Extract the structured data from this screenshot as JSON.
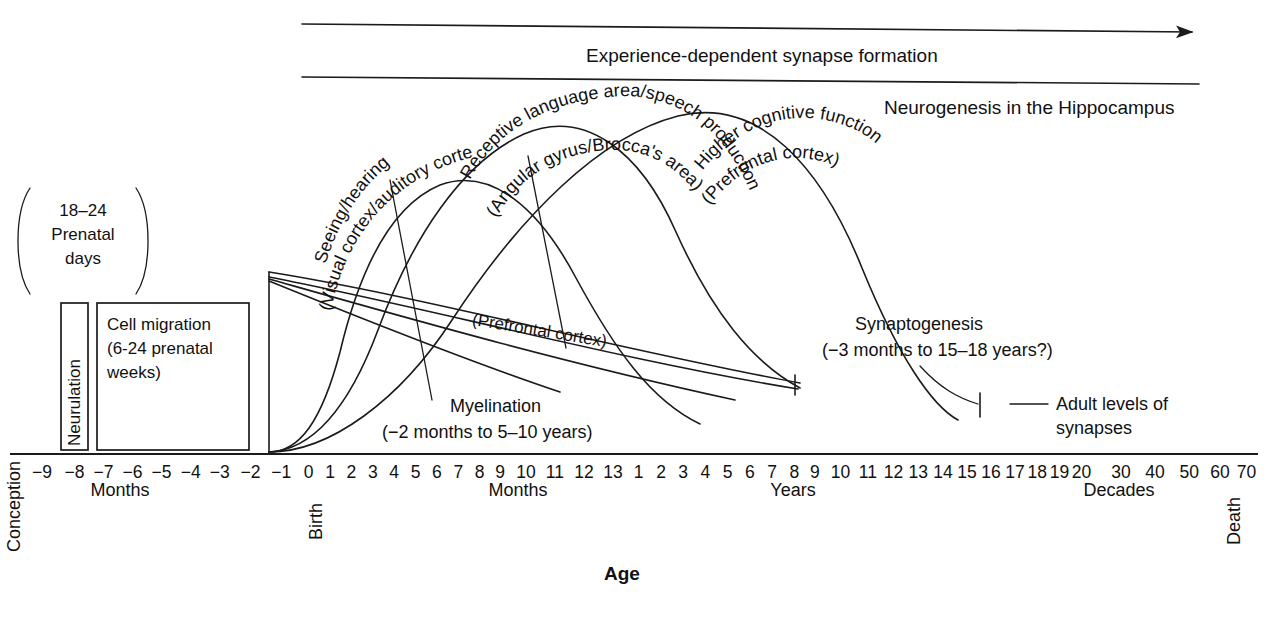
{
  "figure": {
    "axis_title": "Age",
    "ink_color": "#1b1b1b",
    "background": "#ffffff"
  },
  "top_bands": {
    "experience_dependent": "Experience-dependent synapse formation",
    "neurogenesis": "Neurogenesis in the Hippocampus"
  },
  "prenatal": {
    "bracket_line1": "18–24",
    "bracket_line2": "Prenatal",
    "bracket_line3": "days",
    "neurulation": "Neurulation",
    "cell_migration_line1": "Cell migration",
    "cell_migration_line2": "(6-24 prenatal",
    "cell_migration_line3": "weeks)"
  },
  "curves": {
    "sensory_line1": "Seeing/hearing",
    "sensory_line2": "(Visual cortex/auditory cortex)",
    "language_line1": "Receptive language area/speech production",
    "language_line2": "(Angular gyrus/Brocca's area)",
    "cognitive_line1": "Higher cognitive function",
    "cognitive_line2": "(Prefrontal cortex)"
  },
  "annotations": {
    "myelination_line1": "Myelination",
    "myelination_line2": "(−2 months to 5–10 years)",
    "myelination_region": "(Prefrontal cortex)",
    "synaptogenesis_line1": "Synaptogenesis",
    "synaptogenesis_line2": "(−3 months to 15–18 years?)",
    "adult_levels_line1": "Adult levels of",
    "adult_levels_line2": "synapses"
  },
  "axis": {
    "label_conception": "Conception",
    "label_birth": "Birth",
    "label_death": "Death",
    "unit_months_prenatal": "Months",
    "unit_months_postnatal": "Months",
    "unit_years": "Years",
    "unit_decades": "Decades",
    "ticks": [
      {
        "label": "−9",
        "x": 28
      },
      {
        "label": "−8",
        "x": 66
      },
      {
        "label": "−7",
        "x": 100
      },
      {
        "label": "−6",
        "x": 134
      },
      {
        "label": "−5",
        "x": 168
      },
      {
        "label": "−4",
        "x": 202
      },
      {
        "label": "−3",
        "x": 236
      },
      {
        "label": "−2",
        "x": 272
      },
      {
        "label": "−1",
        "x": 308
      },
      {
        "label": "0",
        "x": 340
      },
      {
        "label": "1",
        "x": 365
      },
      {
        "label": "2",
        "x": 390
      },
      {
        "label": "3",
        "x": 415
      },
      {
        "label": "4",
        "x": 440
      },
      {
        "label": "5",
        "x": 465
      },
      {
        "label": "6",
        "x": 490
      },
      {
        "label": "7",
        "x": 515
      },
      {
        "label": "8",
        "x": 540
      },
      {
        "label": "9",
        "x": 564
      },
      {
        "label": "10",
        "x": 594
      },
      {
        "label": "11",
        "x": 628
      },
      {
        "label": "12",
        "x": 662
      },
      {
        "label": "13",
        "x": 696
      },
      {
        "label": "1",
        "x": 726
      },
      {
        "label": "2",
        "x": 752
      },
      {
        "label": "3",
        "x": 778
      },
      {
        "label": "4",
        "x": 804
      },
      {
        "label": "5",
        "x": 830
      },
      {
        "label": "6",
        "x": 856
      },
      {
        "label": "7",
        "x": 882
      },
      {
        "label": "8",
        "x": 908
      },
      {
        "label": "9",
        "x": 932
      },
      {
        "label": "10",
        "x": 962
      },
      {
        "label": "11",
        "x": 994
      },
      {
        "label": "12",
        "x": 1024
      },
      {
        "label": "13",
        "x": 1053
      },
      {
        "label": "14",
        "x": 1082
      },
      {
        "label": "15",
        "x": 1110
      },
      {
        "label": "16",
        "x": 1138
      },
      {
        "label": "17",
        "x": 1166
      },
      {
        "label": "18",
        "x": 1192
      },
      {
        "label": "19",
        "x": 1218
      },
      {
        "label": "20",
        "x": 1244
      },
      {
        "label": "30",
        "x": 1290
      },
      {
        "label": "40",
        "x": 1330
      },
      {
        "label": "50",
        "x": 1370
      },
      {
        "label": "60",
        "x": 1406
      },
      {
        "label": "70",
        "x": 1437
      }
    ]
  },
  "chart_data": {
    "type": "line",
    "xlabel": "Age",
    "ylabel": "",
    "grid": false,
    "legend_position": "inline-curve-labels",
    "x_axis": {
      "segments": [
        {
          "unit": "Months",
          "phase": "prenatal",
          "ticks": [
            -9,
            -8,
            -7,
            -6,
            -5,
            -4,
            -3,
            -2,
            -1
          ]
        },
        {
          "unit": "Months",
          "phase": "postnatal",
          "ticks": [
            0,
            1,
            2,
            3,
            4,
            5,
            6,
            7,
            8,
            9,
            10,
            11,
            12,
            13
          ]
        },
        {
          "unit": "Years",
          "phase": "childhood-adolescence",
          "ticks": [
            1,
            2,
            3,
            4,
            5,
            6,
            7,
            8,
            9,
            10,
            11,
            12,
            13,
            14,
            15,
            16,
            17,
            18,
            19,
            20
          ]
        },
        {
          "unit": "Decades",
          "phase": "adulthood",
          "ticks": [
            30,
            40,
            50,
            60,
            70
          ]
        }
      ],
      "endpoint_labels": [
        "Conception",
        "Birth",
        "Death"
      ]
    },
    "series": [
      {
        "name": "Seeing/hearing (Visual cortex/auditory cortex)",
        "process": "synaptogenesis",
        "onset": "-3 months",
        "peak": "4-8 months postnatal",
        "decline_to_adult": "~10 years",
        "points": [
          [
            -2,
            0
          ],
          [
            0,
            20
          ],
          [
            2,
            55
          ],
          [
            4,
            88
          ],
          [
            6,
            95
          ],
          [
            8,
            88
          ],
          [
            10,
            75
          ],
          [
            13,
            60
          ],
          [
            36,
            38
          ],
          [
            120,
            12
          ]
        ]
      },
      {
        "name": "Receptive language area/speech production (Angular gyrus/Brocca's area)",
        "process": "synaptogenesis",
        "onset": "-3 months",
        "peak": "~12 months postnatal",
        "decline_to_adult": "~10 years",
        "points": [
          [
            -2,
            0
          ],
          [
            1,
            15
          ],
          [
            4,
            45
          ],
          [
            8,
            80
          ],
          [
            12,
            97
          ],
          [
            13,
            96
          ],
          [
            24,
            78
          ],
          [
            60,
            45
          ],
          [
            120,
            12
          ]
        ]
      },
      {
        "name": "Higher cognitive function (Prefrontal cortex)",
        "process": "synaptogenesis",
        "onset": "-3 months",
        "peak": "~1-2 years",
        "decline_to_adult": "15-18 years",
        "points": [
          [
            12,
            90
          ],
          [
            18,
            100
          ],
          [
            36,
            92
          ],
          [
            60,
            75
          ],
          [
            96,
            50
          ],
          [
            144,
            28
          ],
          [
            204,
            8
          ]
        ]
      },
      {
        "name": "Myelination (Prefrontal cortex)",
        "process": "myelination",
        "onset": "-2 months",
        "completion": "5-10 years",
        "points": [
          [
            -2,
            62
          ],
          [
            0,
            58
          ],
          [
            24,
            42
          ],
          [
            60,
            28
          ],
          [
            108,
            16
          ]
        ]
      }
    ],
    "bands": [
      {
        "name": "Experience-dependent synapse formation",
        "start": "birth",
        "end": "death",
        "arrow": true
      },
      {
        "name": "Neurogenesis in the Hippocampus",
        "start": "birth",
        "end": "death",
        "arrow": false
      }
    ],
    "boxes": [
      {
        "name": "Neurulation",
        "start_month": -8,
        "end_month": -7,
        "note": "18-24 prenatal days"
      },
      {
        "name": "Cell migration",
        "start_month": -7,
        "end_month": -2.2,
        "note": "6-24 prenatal weeks"
      }
    ],
    "markers": [
      {
        "name": "Adult levels of synapses",
        "at": "~17-18 years"
      }
    ]
  }
}
